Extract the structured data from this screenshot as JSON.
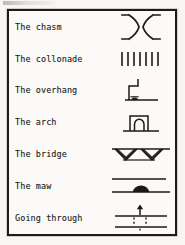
{
  "figure": {
    "paper_color": "#f7f6f3",
    "ink_color": "#1b1a18",
    "border_color": "#1d1c1a",
    "rows": [
      {
        "label": "The chasm",
        "symbol": "chasm-glyph"
      },
      {
        "label": "The collonade",
        "symbol": "collonade-glyph"
      },
      {
        "label": "The overhang",
        "symbol": "overhang-glyph"
      },
      {
        "label": "The arch",
        "symbol": "arch-glyph"
      },
      {
        "label": "The bridge",
        "symbol": "bridge-glyph"
      },
      {
        "label": "The maw",
        "symbol": "maw-glyph"
      },
      {
        "label": "Going through",
        "symbol": "going-through-glyph"
      }
    ]
  }
}
